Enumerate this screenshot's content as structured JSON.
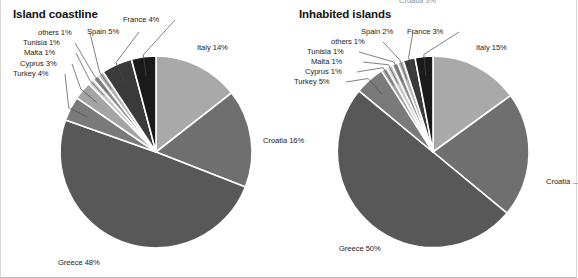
{
  "figure": {
    "background": "#ffffff",
    "separator_color": "#ffffff",
    "clipped_top_label": "Croatia 3%"
  },
  "palette": {
    "italy": "#a9a9a9",
    "croatia": "#6f6f6f",
    "greece": "#585858",
    "turkey": "#7a7a7a",
    "cyprus": "#a4a4a4",
    "malta": "#c9c9c9",
    "tunisia": "#8e8e8e",
    "others": "#b5b5b5",
    "spain": "#3a3a3a",
    "france": "#1a1a1a",
    "separator": "#ffffff"
  },
  "charts": [
    {
      "id": "island-coastline",
      "title": "Island coastline",
      "type": "pie",
      "center": {
        "x": 155,
        "y": 152
      },
      "radius": 96,
      "start_angle_deg": -90,
      "labels": [
        {
          "key": "italy",
          "text": "Italy 14%",
          "x": 196,
          "y": 43,
          "align": "left",
          "leader": false
        },
        {
          "key": "croatia",
          "text": "Croatia 16%",
          "x": 262,
          "y": 136,
          "align": "left",
          "leader": false
        },
        {
          "key": "greece",
          "text": "Greece 48%",
          "x": 57,
          "y": 258,
          "align": "left",
          "leader": false
        },
        {
          "key": "turkey",
          "text": "Turkey 4%",
          "x": 12,
          "y": 69,
          "align": "left",
          "leader": true
        },
        {
          "key": "cyprus",
          "text": "Cyprus 3%",
          "x": 19,
          "y": 59,
          "align": "left",
          "leader": true
        },
        {
          "key": "malta",
          "text": "Malta 1%",
          "x": 23,
          "y": 48,
          "align": "left",
          "leader": true
        },
        {
          "key": "tunisia",
          "text": "Tunisia 1%",
          "x": 22,
          "y": 38,
          "align": "left",
          "leader": true
        },
        {
          "key": "others",
          "text": "others 1%",
          "x": 37,
          "y": 28,
          "align": "left",
          "leader": true
        },
        {
          "key": "spain",
          "text": "Spain 5%",
          "x": 86,
          "y": 27,
          "align": "left",
          "leader": true
        },
        {
          "key": "france",
          "text": "France 4%",
          "x": 122,
          "y": 15,
          "align": "left",
          "leader": true
        }
      ]
    },
    {
      "id": "inhabited-islands",
      "title": "Inhabited islands",
      "type": "pie",
      "center": {
        "x": 144,
        "y": 152
      },
      "radius": 96,
      "start_angle_deg": -90,
      "labels": [
        {
          "key": "italy",
          "text": "Italy 15%",
          "x": 187,
          "y": 43,
          "align": "left",
          "leader": false
        },
        {
          "key": "croatia",
          "text": "Croatia ...",
          "x": 257,
          "y": 177,
          "align": "left",
          "leader": false
        },
        {
          "key": "greece",
          "text": "Greece 50%",
          "x": 50,
          "y": 244,
          "align": "left",
          "leader": false
        },
        {
          "key": "turkey",
          "text": "Turkey 5%",
          "x": 5,
          "y": 77,
          "align": "left",
          "leader": true
        },
        {
          "key": "cyprus",
          "text": "Cyprus 1%",
          "x": 16,
          "y": 67,
          "align": "left",
          "leader": true
        },
        {
          "key": "malta",
          "text": "Malta 1%",
          "x": 22,
          "y": 57,
          "align": "left",
          "leader": true
        },
        {
          "key": "tunisia",
          "text": "Tunisia 1%",
          "x": 18,
          "y": 47,
          "align": "left",
          "leader": true
        },
        {
          "key": "others",
          "text": "others 1%",
          "x": 42,
          "y": 37,
          "align": "left",
          "leader": true
        },
        {
          "key": "spain",
          "text": "Spain 2%",
          "x": 72,
          "y": 27,
          "align": "left",
          "leader": true
        },
        {
          "key": "france",
          "text": "France 3%",
          "x": 118,
          "y": 27,
          "align": "left",
          "leader": true
        }
      ]
    }
  ],
  "chart_data": [
    {
      "type": "pie",
      "title": "Island coastline",
      "xlabel": "",
      "ylabel": "",
      "unit": "percent",
      "legend": "none",
      "grid": false,
      "categories": [
        "Italy",
        "Croatia",
        "Greece",
        "Turkey",
        "Cyprus",
        "Malta",
        "Tunisia",
        "others",
        "Spain",
        "France"
      ],
      "values": [
        14,
        16,
        48,
        4,
        3,
        1,
        1,
        1,
        5,
        4
      ],
      "labels": [
        "Italy 14%",
        "Croatia 16%",
        "Greece 48%",
        "Turkey 4%",
        "Cyprus 3%",
        "Malta 1%",
        "Tunisia 1%",
        "others 1%",
        "Spain 5%",
        "France 4%"
      ],
      "colors": [
        "#a9a9a9",
        "#6f6f6f",
        "#585858",
        "#7a7a7a",
        "#a4a4a4",
        "#c9c9c9",
        "#8e8e8e",
        "#b5b5b5",
        "#3a3a3a",
        "#1a1a1a"
      ]
    },
    {
      "type": "pie",
      "title": "Inhabited islands",
      "xlabel": "",
      "ylabel": "",
      "unit": "percent",
      "legend": "none",
      "grid": false,
      "categories": [
        "Italy",
        "Croatia",
        "Greece",
        "Turkey",
        "Cyprus",
        "Malta",
        "Tunisia",
        "others",
        "Spain",
        "France"
      ],
      "values": [
        15,
        21,
        50,
        5,
        1,
        1,
        1,
        1,
        2,
        3
      ],
      "labels": [
        "Italy 15%",
        "Croatia ...",
        "Greece 50%",
        "Turkey 5%",
        "Cyprus 1%",
        "Malta 1%",
        "Tunisia 1%",
        "others 1%",
        "Spain 2%",
        "France 3%"
      ],
      "colors": [
        "#a9a9a9",
        "#6f6f6f",
        "#585858",
        "#7a7a7a",
        "#a4a4a4",
        "#c9c9c9",
        "#8e8e8e",
        "#b5b5b5",
        "#3a3a3a",
        "#1a1a1a"
      ]
    }
  ]
}
